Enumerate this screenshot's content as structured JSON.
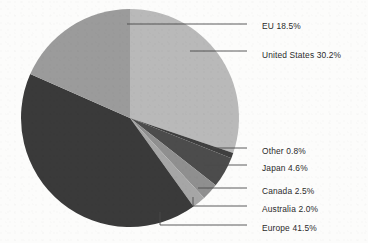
{
  "figure": {
    "background_color": "#fcfcfb",
    "text_color": "#2b2b2b",
    "leader_line_color": "#4a4a4a",
    "center_x": 130,
    "center_y": 118,
    "radius": 109
  },
  "chart_data": {
    "type": "pie",
    "title": "",
    "xlabel": "",
    "ylabel": "",
    "grid": false,
    "legend_position": "callout-labels-right",
    "label_format": "{name} {value}%",
    "units": "percent",
    "total": 100.1,
    "start_angle_deg": 0,
    "direction": "clockwise",
    "categories": [
      "United States",
      "Other",
      "Japan",
      "Canada",
      "Australia",
      "Europe",
      "EU"
    ],
    "values": [
      30.2,
      0.8,
      4.6,
      2.5,
      2.0,
      41.5,
      18.5
    ],
    "colors": [
      "#b9b9b9",
      "#3f3f3f",
      "#4c4c4c",
      "#8f8f8f",
      "#a6a6a6",
      "#3a3a3a",
      "#9b9b9b"
    ],
    "slices": [
      {
        "name": "United States",
        "value": 30.2,
        "label": "United States 30.2%",
        "color": "#b9b9b9",
        "start_deg": 0,
        "end_deg": 108.72
      },
      {
        "name": "Other",
        "value": 0.8,
        "label": "Other 0.8%",
        "color": "#3f3f3f",
        "start_deg": 108.72,
        "end_deg": 111.6
      },
      {
        "name": "Japan",
        "value": 4.6,
        "label": "Japan 4.6%",
        "color": "#4c4c4c",
        "start_deg": 111.6,
        "end_deg": 128.16
      },
      {
        "name": "Canada",
        "value": 2.5,
        "label": "Canada 2.5%",
        "color": "#8f8f8f",
        "start_deg": 128.16,
        "end_deg": 137.16
      },
      {
        "name": "Australia",
        "value": 2.0,
        "label": "Australia 2.0%",
        "color": "#a6a6a6",
        "start_deg": 137.16,
        "end_deg": 144.36
      },
      {
        "name": "Europe",
        "value": 41.5,
        "label": "Europe 41.5%",
        "color": "#3a3a3a",
        "start_deg": 144.36,
        "end_deg": 293.76
      },
      {
        "name": "EU",
        "value": 18.5,
        "label": "EU 18.5%",
        "color": "#9b9b9b",
        "start_deg": 293.76,
        "end_deg": 360
      }
    ]
  },
  "callouts": [
    {
      "key": "eu",
      "label": "EU 18.5%",
      "text_x": 262,
      "text_y": 22,
      "line": "M 127,24 L 247,24"
    },
    {
      "key": "united_states",
      "label": "United States 30.2%",
      "text_x": 262,
      "text_y": 51,
      "line": "M 190,51 L 247,51"
    },
    {
      "key": "other",
      "label": "Other 0.8%",
      "text_x": 262,
      "text_y": 147,
      "line": "M 212,148 L 247,148"
    },
    {
      "key": "japan",
      "label": "Japan 4.6%",
      "text_x": 262,
      "text_y": 164,
      "line": "M 204,165 L 247,165"
    },
    {
      "key": "canada",
      "label": "Canada 2.5%",
      "text_x": 262,
      "text_y": 187,
      "line": "M 198,188 L 247,188"
    },
    {
      "key": "australia",
      "label": "Australia 2.0%",
      "text_x": 262,
      "text_y": 205,
      "line": "M 193,197 L 193,206 L 247,206"
    },
    {
      "key": "europe",
      "label": "Europe 41.5%",
      "text_x": 262,
      "text_y": 224,
      "line": "M 160,212 L 160,225 L 247,225"
    }
  ]
}
